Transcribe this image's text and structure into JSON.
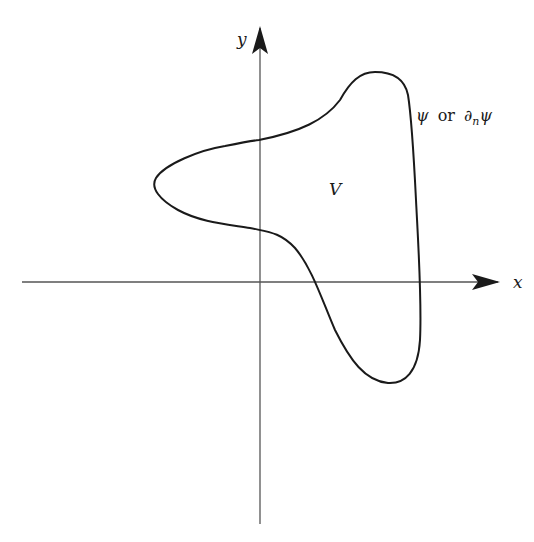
{
  "diagram": {
    "axes": {
      "x_label": "x",
      "y_label": "y"
    },
    "region_label": "V",
    "boundary_label": {
      "psi": "ψ",
      "or": "or",
      "partial": "∂",
      "subscript": "n",
      "psi2": "ψ"
    },
    "colors": {
      "ink": "#1a1a1a",
      "axis": "#555555",
      "background": "#ffffff"
    }
  }
}
